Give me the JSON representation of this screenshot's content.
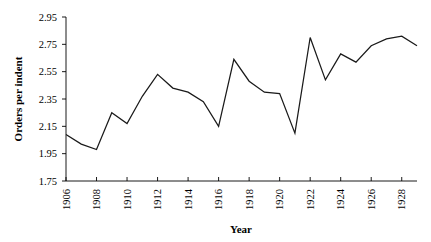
{
  "chart_data": {
    "type": "line",
    "title": "",
    "xlabel": "Year",
    "ylabel": "Orders per indent",
    "xlim": [
      1906,
      1929
    ],
    "ylim": [
      1.75,
      2.95
    ],
    "grid": false,
    "legend": "none",
    "y_ticks": [
      "1.75",
      "1.95",
      "2.15",
      "2.35",
      "2.55",
      "2.75",
      "2.95"
    ],
    "y_tick_values": [
      1.75,
      1.95,
      2.15,
      2.35,
      2.55,
      2.75,
      2.95
    ],
    "x_ticks": [
      "1906",
      "1908",
      "1910",
      "1912",
      "1914",
      "1916",
      "1918",
      "1920",
      "1922",
      "1924",
      "1926",
      "1928"
    ],
    "x_tick_values": [
      1906,
      1908,
      1910,
      1912,
      1914,
      1916,
      1918,
      1920,
      1922,
      1924,
      1926,
      1928
    ],
    "x": [
      1906,
      1907,
      1908,
      1909,
      1910,
      1911,
      1912,
      1913,
      1914,
      1915,
      1916,
      1917,
      1918,
      1919,
      1920,
      1921,
      1922,
      1923,
      1924,
      1925,
      1926,
      1927,
      1928,
      1929
    ],
    "values": [
      2.09,
      2.02,
      1.98,
      2.25,
      2.17,
      2.37,
      2.53,
      2.43,
      2.4,
      2.33,
      2.15,
      2.64,
      2.48,
      2.4,
      2.39,
      2.1,
      2.8,
      2.49,
      2.68,
      2.62,
      2.74,
      2.79,
      2.81,
      2.74
    ],
    "series": [
      {
        "name": "Orders per indent",
        "color": "#1a1a1a",
        "values": [
          2.09,
          2.02,
          1.98,
          2.25,
          2.17,
          2.37,
          2.53,
          2.43,
          2.4,
          2.33,
          2.15,
          2.64,
          2.48,
          2.4,
          2.39,
          2.1,
          2.8,
          2.49,
          2.68,
          2.62,
          2.74,
          2.79,
          2.81,
          2.74
        ]
      }
    ]
  },
  "geometry": {
    "plot_left": 66,
    "plot_right": 417,
    "plot_top": 17,
    "plot_bottom": 181,
    "x_tick_rotation": -90
  }
}
